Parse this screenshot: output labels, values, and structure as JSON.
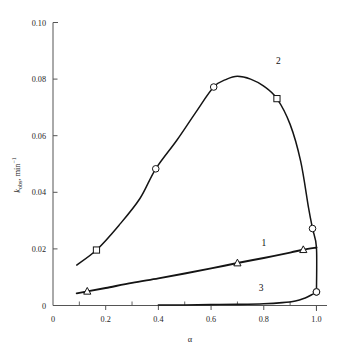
{
  "chart_data": {
    "type": "line",
    "title": "",
    "xlabel": "α",
    "ylabel": "k_obs, min^-1",
    "xlim": [
      0,
      1.04
    ],
    "ylim": [
      0,
      0.1
    ],
    "grid": false,
    "legend": "inline-curve-numbers",
    "xticks": [
      0,
      0.2,
      0.4,
      0.6,
      0.8,
      1.0
    ],
    "xtick_labels": [
      "0",
      "0.2",
      "0.4",
      "0.6",
      "0.8",
      "1.0"
    ],
    "xticks_minor": [
      0.1,
      0.3,
      0.5,
      0.7,
      0.9
    ],
    "yticks": [
      0,
      0.02,
      0.04,
      0.06,
      0.08,
      0.1
    ],
    "ytick_labels": [
      "0",
      "0.02",
      "0.04",
      "0.06",
      "0.08",
      "0.10"
    ],
    "series": [
      {
        "name": "1",
        "label": "1",
        "marker": "triangle",
        "label_x": 0.8,
        "label_y": 0.0212,
        "x": [
          0.09,
          0.13,
          0.2,
          0.3,
          0.4,
          0.5,
          0.6,
          0.7,
          0.8,
          0.9,
          0.95,
          1.0
        ],
        "y": [
          0.0043,
          0.005,
          0.0062,
          0.008,
          0.0096,
          0.0113,
          0.0131,
          0.015,
          0.0168,
          0.0187,
          0.0197,
          0.0205
        ],
        "marker_x": [
          0.13,
          0.7,
          0.95
        ],
        "marker_y": [
          0.005,
          0.015,
          0.0197
        ]
      },
      {
        "name": "2",
        "label": "2",
        "marker": "circle-square",
        "label_x": 0.855,
        "label_y": 0.0855,
        "x": [
          0.09,
          0.165,
          0.25,
          0.33,
          0.39,
          0.47,
          0.54,
          0.61,
          0.66,
          0.7,
          0.75,
          0.8,
          0.85,
          0.9,
          0.94,
          0.97,
          0.985,
          1.0,
          1.0
        ],
        "y": [
          0.0143,
          0.0196,
          0.0283,
          0.0378,
          0.0483,
          0.0584,
          0.068,
          0.0772,
          0.08,
          0.081,
          0.08,
          0.0775,
          0.0731,
          0.064,
          0.051,
          0.0345,
          0.0272,
          0.0205,
          0.0048
        ],
        "marker_x": [
          0.165,
          0.39,
          0.61,
          0.85,
          0.985,
          1.0
        ],
        "marker_y": [
          0.0196,
          0.0483,
          0.0772,
          0.0731,
          0.0272,
          0.0048
        ],
        "marker_types": [
          "square",
          "circle",
          "circle",
          "square",
          "circle",
          "circle"
        ]
      },
      {
        "name": "3",
        "label": "3",
        "marker": "circle",
        "label_x": 0.79,
        "label_y": 0.0053,
        "x": [
          0.4,
          0.5,
          0.6,
          0.7,
          0.8,
          0.87,
          0.92,
          0.955,
          0.98,
          1.0
        ],
        "y": [
          0.0002,
          0.0002,
          0.0003,
          0.0004,
          0.0006,
          0.001,
          0.0016,
          0.0026,
          0.0037,
          0.0048
        ],
        "marker_x": [
          1.0
        ],
        "marker_y": [
          0.0048
        ]
      }
    ]
  },
  "axes": {
    "y_axis_label_main": "k",
    "y_axis_label_sub": "obs",
    "y_axis_label_rest": ", min",
    "y_axis_label_sup": "−1",
    "x_axis_label": "α"
  },
  "colors": {
    "curve": "#141414",
    "axis": "#555555",
    "text": "#1a1a1a",
    "background": "#ffffff"
  }
}
